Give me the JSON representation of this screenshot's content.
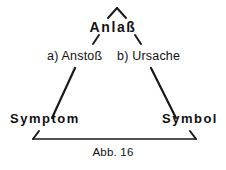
{
  "figure": {
    "caption": "Abb. 16",
    "background_color": "#ffffff",
    "line_color": "#1a1a1a",
    "nodes": {
      "apex": "Anlaß",
      "mid_left": "a) Anstoß",
      "mid_right": "b) Ursache",
      "bottom_left": "Symptom",
      "bottom_right": "Symbol"
    }
  }
}
